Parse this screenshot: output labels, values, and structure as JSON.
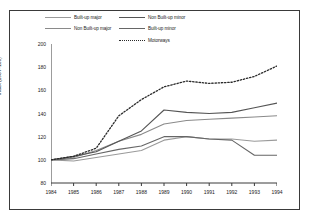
{
  "chart_data": {
    "type": "line",
    "title": "",
    "subtitle": "",
    "xlabel": "",
    "ylabel": "Index (1984=100)",
    "x": [
      1984,
      1985,
      1986,
      1987,
      1988,
      1989,
      1990,
      1991,
      1992,
      1993,
      1994
    ],
    "xticklabels": [
      "1984",
      "1985",
      "1986",
      "1987",
      "1988",
      "1989",
      "1990",
      "1991",
      "1992",
      "1993",
      "1994"
    ],
    "yticklabels": [
      "80",
      "100",
      "120",
      "140",
      "160",
      "180",
      "200"
    ],
    "yticks": [
      80,
      100,
      120,
      140,
      160,
      180,
      200
    ],
    "ylim": [
      80,
      200
    ],
    "xlim": [
      1984,
      1994
    ],
    "grid": false,
    "legend_position": "top",
    "series": [
      {
        "name": "Built-up major",
        "color": "#9a9a9a",
        "style": "solid",
        "values": [
          100,
          99,
          102,
          105,
          108,
          117,
          120,
          118,
          118,
          116,
          117
        ]
      },
      {
        "name": "Non Built-up major",
        "color": "#8a8a8a",
        "style": "solid",
        "values": [
          100,
          102,
          108,
          116,
          122,
          131,
          134,
          135,
          136,
          137,
          138
        ]
      },
      {
        "name": "Non Built-up minor",
        "color": "#555555",
        "style": "solid",
        "values": [
          100,
          103,
          107,
          116,
          125,
          143,
          141,
          140,
          141,
          145,
          149
        ]
      },
      {
        "name": "Built-up minor",
        "color": "#666666",
        "style": "solid",
        "values": [
          100,
          101,
          105,
          109,
          112,
          120,
          120,
          118,
          117,
          104,
          104
        ]
      },
      {
        "name": "Motorways",
        "color": "#2a2a2a",
        "style": "dotted",
        "values": [
          100,
          103,
          110,
          138,
          152,
          163,
          168,
          166,
          167,
          172,
          181
        ]
      }
    ]
  }
}
